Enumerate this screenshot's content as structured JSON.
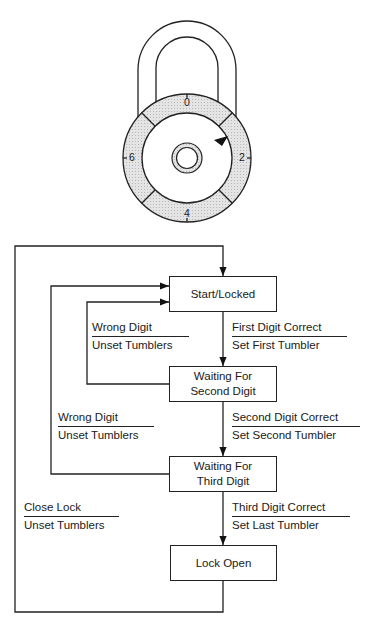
{
  "lock_illustration": {
    "dial_numbers": [
      "0",
      "2",
      "4",
      "6"
    ],
    "colors": {
      "ring_fill": "#dcdcdc",
      "stroke": "#222222",
      "pointer": "#111111"
    }
  },
  "states": [
    {
      "id": "start",
      "line1": "Start/Locked",
      "line2": ""
    },
    {
      "id": "second",
      "line1": "Waiting For",
      "line2": "Second Digit"
    },
    {
      "id": "third",
      "line1": "Waiting For",
      "line2": "Third Digit"
    },
    {
      "id": "open",
      "line1": "Lock Open",
      "line2": ""
    }
  ],
  "transitions": [
    {
      "event": "First Digit Correct",
      "action": "Set First Tumbler"
    },
    {
      "event": "Wrong Digit",
      "action": "Unset Tumblers"
    },
    {
      "event": "Second Digit Correct",
      "action": "Set Second Tumbler"
    },
    {
      "event": "Wrong Digit",
      "action": "Unset Tumblers"
    },
    {
      "event": "Third Digit Correct",
      "action": "Set Last Tumbler"
    },
    {
      "event": "Close Lock",
      "action": "Unset Tumblers"
    }
  ]
}
